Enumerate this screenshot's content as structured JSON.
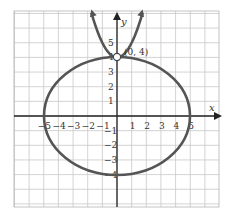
{
  "chart_data": {
    "type": "line",
    "title": "",
    "xlabel": "x",
    "ylabel": "y",
    "xlim": [
      -7,
      7
    ],
    "ylim": [
      -6,
      7
    ],
    "grid": true,
    "x_ticks": [
      "-5",
      "-4",
      "-3",
      "-2",
      "-1",
      "1",
      "2",
      "3",
      "4",
      "5"
    ],
    "y_ticks": [
      "5",
      "4",
      "3",
      "2",
      "1",
      "-1",
      "-2",
      "-3",
      "-4"
    ],
    "series": [
      {
        "name": "ellipse",
        "equation": "x^2/25 + y^2/16 = 1",
        "center": [
          0,
          0
        ],
        "rx": 5,
        "ry": 4
      },
      {
        "name": "parabola",
        "equation": "y = x^2 + 4",
        "vertex": [
          0,
          4
        ]
      }
    ],
    "annotations": [
      {
        "text": "(0, 4)",
        "point": [
          0,
          4
        ],
        "marker": "open-circle"
      }
    ],
    "colors": {
      "curve": "#555555",
      "grid": "#c8c8c8",
      "axis": "#222222"
    }
  }
}
